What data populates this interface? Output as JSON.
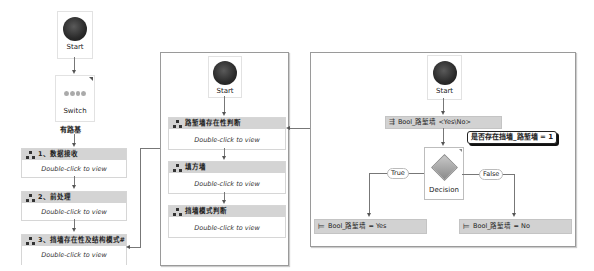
{
  "left_flow": {
    "start_label": "Start",
    "switch_label": "Switch",
    "case_label": "有路基",
    "activities": [
      {
        "title": "1、数据接收",
        "body": "Double-click to view"
      },
      {
        "title": "2、前处理",
        "body": "Double-click to view"
      },
      {
        "title": "3、挡墙存在性及结构模式#",
        "body": "Double-click to view"
      }
    ]
  },
  "middle_flow": {
    "start_label": "Start",
    "activities": [
      {
        "title": "路堑墙存在性判断",
        "body": "Double-click to view"
      },
      {
        "title": "填方墙",
        "body": "Double-click to view"
      },
      {
        "title": "挡墙模式判断",
        "body": "Double-click to view"
      }
    ]
  },
  "right_flow": {
    "start_label": "Start",
    "variable_assign": "Bool_路堑墙 <Yes\\No>",
    "annotation": "是否存在挡墙_路堑墙 = 1",
    "decision_label": "Decision",
    "true_label": "True",
    "false_label": "False",
    "assign_true": "Bool_路堑墙 = Yes",
    "assign_false": "Bool_路堑墙 = No"
  },
  "colors": {
    "header_gray": "#d4d4d4",
    "start_dot": "#2a2a2a",
    "decision_diamond": "#9a9a9a"
  }
}
